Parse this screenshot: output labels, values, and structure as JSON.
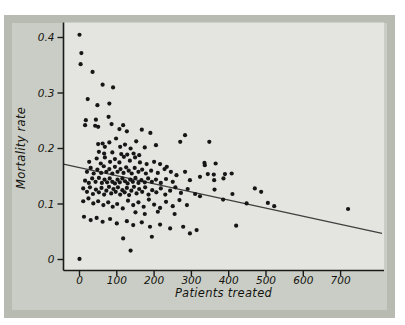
{
  "colors": {
    "page_bg": "#ffffff",
    "panel_border": "#b7bbb2",
    "panel_bg": "#cacdc5",
    "plot_bg": "#e4e5e0",
    "axis": "#1a1a1a",
    "dot": "#161616",
    "trend_line": "#3f3f3f",
    "text": "#14140f"
  },
  "chart_data": {
    "type": "scatter",
    "title": "",
    "xlabel": "Patients treated",
    "ylabel": "Mortality rate",
    "xlim": [
      -43,
      811
    ],
    "ylim": [
      -0.019,
      0.427
    ],
    "grid": false,
    "legend": "none",
    "xtick_values": [
      0,
      100,
      200,
      300,
      400,
      500,
      600,
      700
    ],
    "xtick_labels": [
      "0",
      "100",
      "200",
      "300",
      "400",
      "500",
      "600",
      "700"
    ],
    "ytick_values": [
      0,
      0.1,
      0.2,
      0.3,
      0.4
    ],
    "ytick_labels": [
      "0",
      "0.1",
      "0.2",
      "0.3",
      "0.4"
    ],
    "trend_line": {
      "x1": -43,
      "y1": 0.172,
      "x2": 811,
      "y2": 0.047
    },
    "points": [
      [
        0,
        0.405
      ],
      [
        5,
        0.372
      ],
      [
        3,
        0.352
      ],
      [
        35,
        0.338
      ],
      [
        62,
        0.315
      ],
      [
        90,
        0.31
      ],
      [
        22,
        0.289
      ],
      [
        48,
        0.278
      ],
      [
        80,
        0.281
      ],
      [
        44,
        0.252
      ],
      [
        78,
        0.257
      ],
      [
        15,
        0.242
      ],
      [
        50,
        0.239
      ],
      [
        17,
        0.251
      ],
      [
        42,
        0.241
      ],
      [
        86,
        0.244
      ],
      [
        107,
        0.235
      ],
      [
        117,
        0.242
      ],
      [
        127,
        0.231
      ],
      [
        167,
        0.234
      ],
      [
        190,
        0.228
      ],
      [
        50,
        0.208
      ],
      [
        62,
        0.209
      ],
      [
        68,
        0.203
      ],
      [
        80,
        0.211
      ],
      [
        98,
        0.218
      ],
      [
        109,
        0.203
      ],
      [
        122,
        0.207
      ],
      [
        137,
        0.2
      ],
      [
        152,
        0.213
      ],
      [
        175,
        0.202
      ],
      [
        205,
        0.206
      ],
      [
        270,
        0.212
      ],
      [
        283,
        0.224
      ],
      [
        348,
        0.212
      ],
      [
        52,
        0.194
      ],
      [
        66,
        0.191
      ],
      [
        88,
        0.193
      ],
      [
        112,
        0.19
      ],
      [
        128,
        0.189
      ],
      [
        145,
        0.191
      ],
      [
        160,
        0.188
      ],
      [
        26,
        0.176
      ],
      [
        46,
        0.182
      ],
      [
        57,
        0.173
      ],
      [
        68,
        0.184
      ],
      [
        82,
        0.176
      ],
      [
        95,
        0.181
      ],
      [
        107,
        0.175
      ],
      [
        119,
        0.185
      ],
      [
        135,
        0.178
      ],
      [
        149,
        0.184
      ],
      [
        162,
        0.175
      ],
      [
        180,
        0.172
      ],
      [
        200,
        0.176
      ],
      [
        216,
        0.172
      ],
      [
        234,
        0.167
      ],
      [
        335,
        0.174
      ],
      [
        336,
        0.17
      ],
      [
        365,
        0.173
      ],
      [
        20,
        0.158
      ],
      [
        30,
        0.165
      ],
      [
        38,
        0.155
      ],
      [
        48,
        0.162
      ],
      [
        58,
        0.156
      ],
      [
        65,
        0.168
      ],
      [
        72,
        0.158
      ],
      [
        80,
        0.163
      ],
      [
        88,
        0.155
      ],
      [
        95,
        0.167
      ],
      [
        102,
        0.158
      ],
      [
        110,
        0.163
      ],
      [
        118,
        0.156
      ],
      [
        125,
        0.166
      ],
      [
        132,
        0.16
      ],
      [
        140,
        0.155
      ],
      [
        148,
        0.165
      ],
      [
        158,
        0.158
      ],
      [
        168,
        0.162
      ],
      [
        178,
        0.155
      ],
      [
        192,
        0.16
      ],
      [
        210,
        0.156
      ],
      [
        228,
        0.163
      ],
      [
        245,
        0.158
      ],
      [
        260,
        0.152
      ],
      [
        283,
        0.158
      ],
      [
        344,
        0.154
      ],
      [
        360,
        0.153
      ],
      [
        390,
        0.154
      ],
      [
        408,
        0.155
      ],
      [
        15,
        0.142
      ],
      [
        25,
        0.138
      ],
      [
        34,
        0.146
      ],
      [
        43,
        0.14
      ],
      [
        52,
        0.147
      ],
      [
        60,
        0.138
      ],
      [
        67,
        0.144
      ],
      [
        74,
        0.139
      ],
      [
        81,
        0.146
      ],
      [
        88,
        0.14
      ],
      [
        95,
        0.137
      ],
      [
        102,
        0.144
      ],
      [
        108,
        0.139
      ],
      [
        115,
        0.146
      ],
      [
        122,
        0.141
      ],
      [
        129,
        0.137
      ],
      [
        136,
        0.144
      ],
      [
        143,
        0.14
      ],
      [
        150,
        0.147
      ],
      [
        158,
        0.138
      ],
      [
        166,
        0.143
      ],
      [
        175,
        0.139
      ],
      [
        184,
        0.146
      ],
      [
        194,
        0.14
      ],
      [
        205,
        0.144
      ],
      [
        218,
        0.138
      ],
      [
        232,
        0.145
      ],
      [
        250,
        0.14
      ],
      [
        296,
        0.143
      ],
      [
        323,
        0.149
      ],
      [
        361,
        0.143
      ],
      [
        386,
        0.146
      ],
      [
        10,
        0.128
      ],
      [
        20,
        0.122
      ],
      [
        28,
        0.13
      ],
      [
        36,
        0.118
      ],
      [
        44,
        0.126
      ],
      [
        52,
        0.121
      ],
      [
        59,
        0.129
      ],
      [
        66,
        0.117
      ],
      [
        72,
        0.124
      ],
      [
        79,
        0.131
      ],
      [
        85,
        0.119
      ],
      [
        91,
        0.127
      ],
      [
        97,
        0.122
      ],
      [
        103,
        0.13
      ],
      [
        109,
        0.117
      ],
      [
        115,
        0.125
      ],
      [
        121,
        0.121
      ],
      [
        127,
        0.129
      ],
      [
        133,
        0.116
      ],
      [
        139,
        0.124
      ],
      [
        146,
        0.131
      ],
      [
        153,
        0.119
      ],
      [
        160,
        0.127
      ],
      [
        168,
        0.122
      ],
      [
        176,
        0.13
      ],
      [
        185,
        0.117
      ],
      [
        195,
        0.125
      ],
      [
        206,
        0.121
      ],
      [
        218,
        0.128
      ],
      [
        230,
        0.117
      ],
      [
        243,
        0.124
      ],
      [
        257,
        0.13
      ],
      [
        272,
        0.12
      ],
      [
        290,
        0.127
      ],
      [
        310,
        0.118
      ],
      [
        362,
        0.126
      ],
      [
        410,
        0.118
      ],
      [
        470,
        0.128
      ],
      [
        487,
        0.122
      ],
      [
        10,
        0.105
      ],
      [
        24,
        0.11
      ],
      [
        37,
        0.101
      ],
      [
        50,
        0.105
      ],
      [
        64,
        0.098
      ],
      [
        77,
        0.103
      ],
      [
        89,
        0.095
      ],
      [
        101,
        0.1
      ],
      [
        116,
        0.092
      ],
      [
        130,
        0.106
      ],
      [
        144,
        0.098
      ],
      [
        158,
        0.103
      ],
      [
        172,
        0.095
      ],
      [
        186,
        0.108
      ],
      [
        200,
        0.099
      ],
      [
        216,
        0.093
      ],
      [
        232,
        0.104
      ],
      [
        250,
        0.096
      ],
      [
        268,
        0.107
      ],
      [
        288,
        0.098
      ],
      [
        323,
        0.114
      ],
      [
        385,
        0.108
      ],
      [
        448,
        0.101
      ],
      [
        505,
        0.102
      ],
      [
        522,
        0.096
      ],
      [
        720,
        0.091
      ],
      [
        12,
        0.077
      ],
      [
        30,
        0.071
      ],
      [
        46,
        0.075
      ],
      [
        62,
        0.068
      ],
      [
        82,
        0.073
      ],
      [
        100,
        0.065
      ],
      [
        127,
        0.069
      ],
      [
        144,
        0.062
      ],
      [
        167,
        0.067
      ],
      [
        189,
        0.059
      ],
      [
        216,
        0.063
      ],
      [
        243,
        0.056
      ],
      [
        278,
        0.059
      ],
      [
        314,
        0.053
      ],
      [
        150,
        0.085
      ],
      [
        175,
        0.082
      ],
      [
        210,
        0.086
      ],
      [
        255,
        0.082
      ],
      [
        420,
        0.061
      ],
      [
        0,
        0.001
      ],
      [
        137,
        0.016
      ],
      [
        117,
        0.038
      ],
      [
        194,
        0.041
      ],
      [
        296,
        0.047
      ]
    ]
  }
}
